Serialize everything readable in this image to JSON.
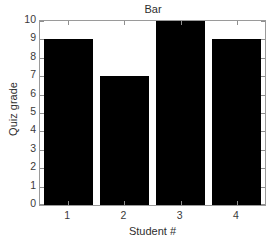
{
  "chart_data": {
    "type": "bar",
    "title": "Bar",
    "xlabel": "Student #",
    "ylabel": "Quiz grade",
    "categories": [
      "1",
      "2",
      "3",
      "4"
    ],
    "values": [
      9,
      7,
      10,
      9
    ],
    "ylim": [
      0,
      10
    ],
    "ytick_labels": [
      "10",
      "9",
      "8",
      "7",
      "6",
      "5",
      "4",
      "3",
      "2",
      "1",
      "0"
    ],
    "ytick_values": [
      10,
      9,
      8,
      7,
      6,
      5,
      4,
      3,
      2,
      1,
      0
    ],
    "xtick_labels": [
      "1",
      "2",
      "3",
      "4"
    ],
    "grid": false,
    "legend": false,
    "bar_color": "#000000",
    "axis_color": "#9a9a9a",
    "background_color": "#ffffff",
    "bar_width_ratio": 0.87
  }
}
